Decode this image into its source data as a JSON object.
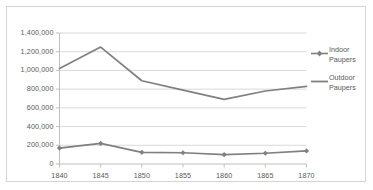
{
  "chart_data": {
    "type": "line",
    "title": "",
    "xlabel": "",
    "ylabel": "",
    "x": [
      1840,
      1845,
      1850,
      1855,
      1860,
      1865,
      1870
    ],
    "categories": [
      "1840",
      "1845",
      "1850",
      "1855",
      "1860",
      "1865",
      "1870"
    ],
    "series": [
      {
        "name": "Indoor Paupers",
        "values": [
          170000,
          220000,
          125000,
          120000,
          100000,
          115000,
          140000
        ],
        "color": "#808080",
        "marker": "diamond"
      },
      {
        "name": "Outdoor Paupers",
        "values": [
          1020000,
          1250000,
          890000,
          790000,
          690000,
          780000,
          830000
        ],
        "color": "#808080",
        "marker": "none"
      }
    ],
    "ylim": [
      0,
      1400000
    ],
    "xlim": [
      1840,
      1870
    ],
    "yticks": [
      0,
      200000,
      400000,
      600000,
      800000,
      1000000,
      1200000,
      1400000
    ],
    "ytick_labels": [
      "0",
      "200,000",
      "400,000",
      "600,000",
      "800,000",
      "1,000,000",
      "1,200,000",
      "1,400,000"
    ],
    "grid": "horizontal",
    "legend_position": "right"
  },
  "legend": {
    "entries": [
      {
        "label_line1": "Indoor",
        "label_line2": "Paupers"
      },
      {
        "label_line1": "Outdoor",
        "label_line2": "Paupers"
      }
    ]
  },
  "colors": {
    "series": "#808080",
    "gridline": "#d9d9d9",
    "axis": "#bfbfbf",
    "border": "#d4d4d4",
    "text": "#595959"
  }
}
